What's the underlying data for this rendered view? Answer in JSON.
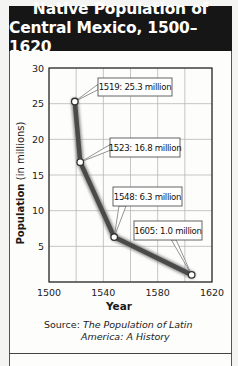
{
  "title": {
    "line1": "Native Population of",
    "line2": "Central Mexico, 1500–1620"
  },
  "source": {
    "prefix": "Source:",
    "title_line1": "The Population of Latin",
    "title_line2": "America: A History"
  },
  "colors": {
    "title_bg": "#161616",
    "title_text": "#ffffff",
    "line": "#4a4a4a",
    "grid": "#b8b8b8",
    "axis": "#222222"
  },
  "chart_data": {
    "type": "line",
    "title": "Native Population of Central Mexico, 1500–1620",
    "xlabel": "Year",
    "ylabel": "Population (in millions)",
    "xlim": [
      1500,
      1620
    ],
    "ylim": [
      0,
      30
    ],
    "xticks": [
      1500,
      1540,
      1580,
      1620
    ],
    "yticks": [
      5,
      10,
      15,
      20,
      25,
      30
    ],
    "grid": true,
    "x_grid_step": 20,
    "y_grid_step": 5,
    "x": [
      1519,
      1523,
      1548,
      1605
    ],
    "series": [
      {
        "name": "Native Population",
        "values": [
          25.3,
          16.8,
          6.3,
          1.0
        ]
      }
    ],
    "annotations": [
      {
        "x": 1519,
        "y": 25.3,
        "text": "1519: 25.3 million"
      },
      {
        "x": 1523,
        "y": 16.8,
        "text": "1523: 16.8 million"
      },
      {
        "x": 1548,
        "y": 6.3,
        "text": "1548: 6.3 million"
      },
      {
        "x": 1605,
        "y": 1.0,
        "text": "1605: 1.0 million"
      }
    ],
    "source": "The Population of Latin America: A History"
  }
}
